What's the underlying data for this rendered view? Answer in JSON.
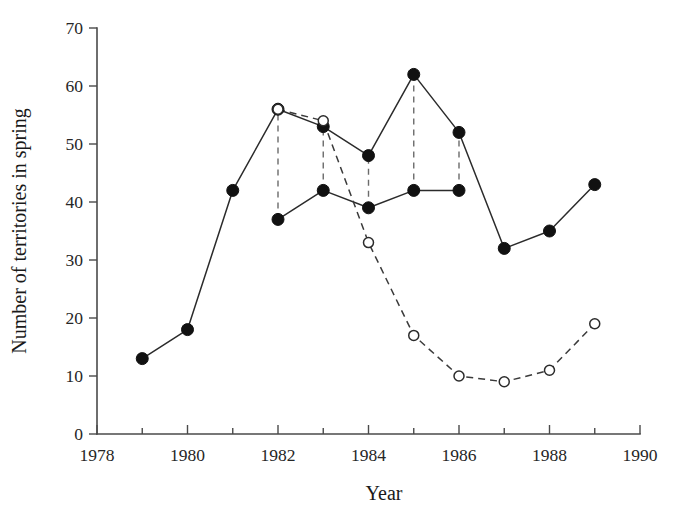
{
  "chart_data": {
    "type": "line",
    "title": "",
    "xlabel": "Year",
    "ylabel": "Number of territories in spring",
    "xlim": [
      1978,
      1990
    ],
    "ylim": [
      0,
      70
    ],
    "grid": false,
    "legend": "none",
    "x_ticks": [
      1978,
      1979,
      1980,
      1981,
      1982,
      1983,
      1984,
      1985,
      1986,
      1987,
      1988,
      1989,
      1990
    ],
    "x_tick_labels": [
      "1978",
      "",
      "1980",
      "",
      "1982",
      "",
      "1984",
      "",
      "1986",
      "",
      "1988",
      "",
      "1990"
    ],
    "x_major_labels": [
      "1978",
      "1980",
      "1982",
      "1984",
      "1986",
      "1988",
      "1990"
    ],
    "y_ticks": [
      0,
      10,
      20,
      30,
      40,
      50,
      60,
      70
    ],
    "y_tick_labels": [
      "0",
      "10",
      "20",
      "30",
      "40",
      "50",
      "60",
      "70"
    ],
    "series": [
      {
        "name": "filled-upper",
        "marker": "filled-circle",
        "line": "solid",
        "x": [
          1979,
          1980,
          1981,
          1982,
          1983,
          1984,
          1985,
          1986,
          1987,
          1988,
          1989
        ],
        "values": [
          13,
          18,
          42,
          56,
          53,
          48,
          62,
          52,
          32,
          35,
          43
        ]
      },
      {
        "name": "filled-lower",
        "marker": "filled-circle",
        "line": "solid",
        "x": [
          1982,
          1983,
          1984,
          1985,
          1986
        ],
        "values": [
          37,
          42,
          39,
          42,
          42
        ]
      },
      {
        "name": "open-dashed",
        "marker": "open-circle",
        "line": "dashed",
        "x": [
          1982,
          1983,
          1984,
          1985,
          1986,
          1987,
          1988,
          1989
        ],
        "values": [
          56,
          54,
          33,
          17,
          10,
          9,
          11,
          19
        ]
      }
    ],
    "connectors": [
      {
        "x": 1982,
        "y0": 37,
        "y1": 56
      },
      {
        "x": 1983,
        "y0": 42,
        "y1": 54
      },
      {
        "x": 1984,
        "y0": 39,
        "y1": 48
      },
      {
        "x": 1985,
        "y0": 42,
        "y1": 62
      },
      {
        "x": 1986,
        "y0": 42,
        "y1": 52
      }
    ]
  },
  "colors": {
    "background": "#ffffff",
    "axis": "#4a4a4a",
    "solid_line": "#2b2b2b",
    "dashed_line": "#3a3a3a",
    "marker_fill": "#111111",
    "marker_open_fill": "#ffffff",
    "text": "#1a1a1a"
  }
}
